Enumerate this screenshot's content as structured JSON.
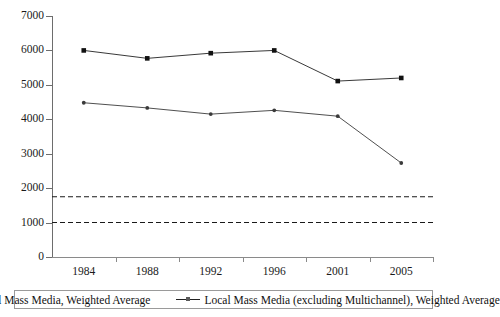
{
  "chart_data": {
    "type": "line",
    "title": "",
    "xlabel": "",
    "ylabel": "",
    "categories": [
      "1984",
      "1988",
      "1992",
      "1996",
      "2001",
      "2005"
    ],
    "ylim": [
      0,
      7000
    ],
    "ytick_step": 1000,
    "yticks": [
      "0",
      "1000",
      "2000",
      "3000",
      "4000",
      "5000",
      "6000",
      "7000"
    ],
    "grid": false,
    "legend_position": "bottom",
    "series": [
      {
        "name": "Local Mass Media, Weighted Average",
        "marker": "filled-square",
        "values": [
          6000,
          5770,
          5920,
          6000,
          5110,
          5200
        ]
      },
      {
        "name": "Local Mass Media (excluding Multichannel), Weighted Average",
        "marker": "small-diamond",
        "values": [
          4480,
          4330,
          4150,
          4260,
          4090,
          2730
        ]
      }
    ],
    "reference_lines": [
      {
        "name": "upper-threshold",
        "value": 1750,
        "style": "dashed"
      },
      {
        "name": "lower-threshold",
        "value": 1000,
        "style": "dashed"
      }
    ]
  },
  "legend": {
    "entries": [
      {
        "label": "Local Mass Media, Weighted Average"
      },
      {
        "label": "Local Mass Media (excluding Multichannel), Weighted Average"
      }
    ]
  },
  "colors": {
    "line": "#222222",
    "marker": "#111111",
    "axis": "#6d6d6d",
    "reference_line": "#1a1a1a",
    "background": "#ffffff"
  }
}
